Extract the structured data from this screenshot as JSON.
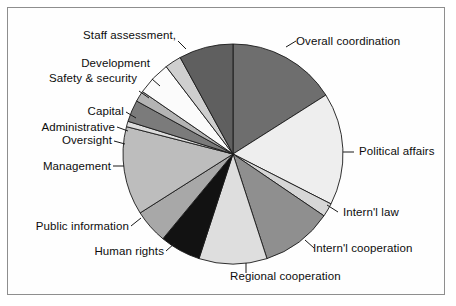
{
  "figure": {
    "border_color": "#8e8e8e",
    "background": "#ffffff",
    "text_color": "#0d0d0d"
  },
  "chart_data": {
    "type": "pie",
    "title": "",
    "subtitle": "",
    "xlabel": "",
    "ylabel": "",
    "legend_position": "none",
    "grid": false,
    "start_angle_deg": 0,
    "direction": "clockwise",
    "center": [
      233,
      154
    ],
    "radius": 110,
    "categories": [
      "Overall coordination",
      "Political affairs",
      "Intern'l law",
      "Intern'l cooperation",
      "Regional cooperation",
      "Human rights",
      "Public information",
      "Management",
      "Oversight",
      "Administrative",
      "Capital",
      "Safety & security",
      "Development",
      "Staff assessment"
    ],
    "values": [
      16.0,
      16.5,
      2.0,
      10.5,
      10.0,
      6.0,
      5.0,
      13.0,
      0.8,
      3.2,
      1.6,
      5.0,
      2.4,
      8.0
    ],
    "value_unit": "percent",
    "slices": [
      {
        "label": "Overall coordination",
        "value": 16.0,
        "start_deg": 0.0,
        "end_deg": 57.6,
        "color": "#6e6e6e"
      },
      {
        "label": "Political affairs",
        "value": 16.5,
        "start_deg": 57.6,
        "end_deg": 117.0,
        "color": "#eeeeee"
      },
      {
        "label": "Intern'l law",
        "value": 2.0,
        "start_deg": 117.0,
        "end_deg": 124.2,
        "color": "#d6d6d6"
      },
      {
        "label": "Intern'l cooperation",
        "value": 10.5,
        "start_deg": 124.2,
        "end_deg": 162.0,
        "color": "#8f8f8f"
      },
      {
        "label": "Regional cooperation",
        "value": 10.0,
        "start_deg": 162.0,
        "end_deg": 198.0,
        "color": "#dedede"
      },
      {
        "label": "Human rights",
        "value": 6.0,
        "start_deg": 198.0,
        "end_deg": 219.6,
        "color": "#121212"
      },
      {
        "label": "Public information",
        "value": 5.0,
        "start_deg": 219.6,
        "end_deg": 237.6,
        "color": "#a8a8a8"
      },
      {
        "label": "Management",
        "value": 13.0,
        "start_deg": 237.6,
        "end_deg": 284.4,
        "color": "#bdbdbd"
      },
      {
        "label": "Oversight",
        "value": 0.8,
        "start_deg": 284.4,
        "end_deg": 287.3,
        "color": "#dcdcdc"
      },
      {
        "label": "Administrative",
        "value": 3.2,
        "start_deg": 287.3,
        "end_deg": 298.8,
        "color": "#7b7b7b"
      },
      {
        "label": "Capital",
        "value": 1.6,
        "start_deg": 298.8,
        "end_deg": 304.6,
        "color": "#b4b4b4"
      },
      {
        "label": "Safety & security",
        "value": 5.0,
        "start_deg": 304.6,
        "end_deg": 322.6,
        "color": "#fbfbfb"
      },
      {
        "label": "Development",
        "value": 2.4,
        "start_deg": 322.6,
        "end_deg": 331.3,
        "color": "#cfcfcf"
      },
      {
        "label": "Staff assessment",
        "value": 8.0,
        "start_deg": 331.3,
        "end_deg": 360.0,
        "color": "#5f5f5f"
      }
    ],
    "annotations": []
  },
  "labels": {
    "overall_coordination": "Overall coordination",
    "political_affairs": "Political affairs",
    "intl_law": "Intern'l law",
    "intl_cooperation": "Intern'l cooperation",
    "regional_cooperation": "Regional cooperation",
    "human_rights": "Human rights",
    "public_information": "Public information",
    "management": "Management",
    "oversight": "Oversight",
    "administrative": "Administrative",
    "capital": "Capital",
    "safety_security": "Safety & security",
    "development": "Development",
    "staff_assessment": "Staff assessment,"
  }
}
